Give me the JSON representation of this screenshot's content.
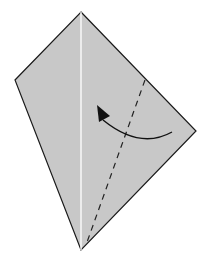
{
  "diagram": {
    "type": "origami-fold-step",
    "colors": {
      "paper": "#c8c8c8",
      "outline": "#1a1a1a",
      "crease": "#ffffff",
      "fold_line": "#222222",
      "arrow": "#111111",
      "background": "#ffffff"
    },
    "shape": {
      "vertices": [
        [
          81,
          12
        ],
        [
          196,
          131
        ],
        [
          81,
          250
        ],
        [
          15,
          80
        ]
      ]
    },
    "center_crease": {
      "from": [
        81,
        12
      ],
      "to": [
        81,
        250
      ]
    },
    "valley_fold_line": {
      "from": [
        145,
        80
      ],
      "to": [
        86,
        245
      ],
      "style": "dashed"
    },
    "fold_arrow": {
      "from": [
        172,
        132
      ],
      "to": [
        96,
        106
      ],
      "direction": "fold-left"
    }
  }
}
